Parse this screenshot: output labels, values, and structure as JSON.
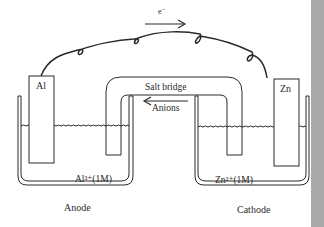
{
  "diagram": {
    "type": "galvanic-cell",
    "electron_label": "e⁻",
    "salt_bridge": {
      "label": "Salt bridge",
      "flow_label": "Anions",
      "flow_direction": "left"
    },
    "left_half_cell": {
      "electrode": "Al",
      "solution": "Al³⁺(1M)",
      "role": "Anode"
    },
    "right_half_cell": {
      "electrode": "Zn",
      "solution": "Zn²⁺(1M)",
      "role": "Cathode"
    },
    "colors": {
      "line": "#2a2a2a",
      "background": "#ffffff",
      "side_strip": "#a9a9a9"
    }
  }
}
